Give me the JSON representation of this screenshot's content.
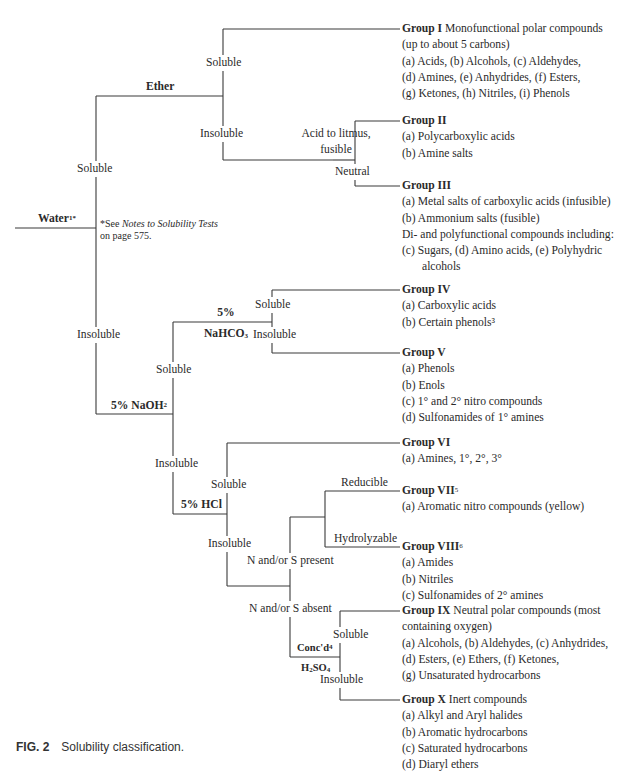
{
  "diagram": {
    "title": "Solubility classification",
    "root": {
      "label": "Water",
      "superscript": "1*"
    },
    "footnote": {
      "prefix": "*See ",
      "italic": "Notes to Solubility Tests",
      "suffix": "on page 575."
    },
    "branches": {
      "water_soluble": "Soluble",
      "water_insoluble": "Insoluble",
      "ether": "Ether",
      "ether_soluble": "Soluble",
      "ether_insoluble": "Insoluble",
      "acid_to_litmus_line1": "Acid to litmus,",
      "acid_to_litmus_line2": "fusible",
      "neutral": "Neutral",
      "naoh_label": "5% NaOH",
      "naoh_sup": "2",
      "naoh_soluble": "Soluble",
      "naoh_insoluble": "Insoluble",
      "nahco3_line1": "5%",
      "nahco3_line2": "NaHCO",
      "nahco3_sub": "3",
      "nahco3_soluble": "Soluble",
      "nahco3_insoluble": "Insoluble",
      "hcl_label": "5% HCl",
      "hcl_soluble": "Soluble",
      "hcl_insoluble": "Insoluble",
      "ns_present": "N and/or S present",
      "ns_absent": "N and/or S absent",
      "reducible": "Reducible",
      "hydrolyzable": "Hydrolyzable",
      "concd_label": "Conc'd",
      "concd_sup": "4",
      "h2so4_h": "H",
      "h2so4_sub2": "2",
      "h2so4_so": "SO",
      "h2so4_sub4": "4",
      "h2so4_soluble": "Soluble",
      "h2so4_insoluble": "Insoluble"
    },
    "groups": [
      {
        "name": "Group I",
        "desc": " Monofunctional polar compounds",
        "lines": [
          "(up to about 5 carbons)",
          "(a) Acids, (b) Alcohols, (c) Aldehydes,",
          "(d) Amines, (e) Anhydrides, (f) Esters,",
          "(g) Ketones, (h) Nitriles, (i) Phenols"
        ]
      },
      {
        "name": "Group II",
        "desc": "",
        "lines": [
          "(a) Polycarboxylic acids",
          "(b) Amine salts"
        ]
      },
      {
        "name": "Group III",
        "desc": "",
        "lines": [
          "(a) Metal salts of carboxylic acids (infusible)",
          "(b) Ammonium salts (fusible)",
          "Di- and polyfunctional compounds including:",
          "(c) Sugars, (d) Amino acids, (e) Polyhydric",
          "      alcohols"
        ]
      },
      {
        "name": "Group IV",
        "desc": "",
        "lines": [
          "(a) Carboxylic acids",
          "(b) Certain phenols³"
        ]
      },
      {
        "name": "Group V",
        "desc": "",
        "lines": [
          "(a) Phenols",
          "(b) Enols",
          "(c) 1° and 2° nitro compounds",
          "(d) Sulfonamides of 1° amines"
        ]
      },
      {
        "name": "Group VI",
        "desc": "",
        "lines": [
          "(a) Amines, 1°, 2°, 3°"
        ]
      },
      {
        "name": "Group VII",
        "sup": "5",
        "desc": "",
        "lines": [
          "(a) Aromatic nitro compounds (yellow)"
        ]
      },
      {
        "name": "Group VIII",
        "sup": "6",
        "desc": "",
        "lines": [
          "(a) Amides",
          "(b) Nitriles",
          "(c) Sulfonamides of 2° amines"
        ]
      },
      {
        "name": "Group IX",
        "desc": " Neutral polar compounds (most",
        "lines": [
          "containing oxygen)",
          "(a) Alcohols, (b) Aldehydes, (c) Anhydrides,",
          "(d) Esters, (e) Ethers, (f) Ketones,",
          "(g) Unsaturated hydrocarbons"
        ]
      },
      {
        "name": "Group X",
        "desc": " Inert compounds",
        "lines": [
          "(a) Alkyl and Aryl halides",
          "(b) Aromatic hydrocarbons",
          "(c) Saturated hydrocarbons",
          "(d) Diaryl ethers"
        ]
      }
    ]
  },
  "caption": {
    "fig": "FIG. 2",
    "text": "Solubility classification."
  },
  "colors": {
    "line": "#3a3a3a",
    "text": "#2a2a2a",
    "background": "#ffffff"
  }
}
